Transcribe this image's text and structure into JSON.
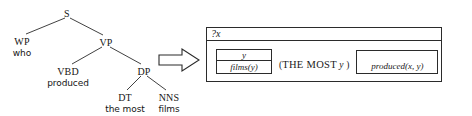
{
  "diagram": {
    "arrow_icon": "right-block-arrow-icon"
  },
  "tree": {
    "nodes": [
      {
        "id": "s",
        "pos": "S",
        "terminal": "",
        "x": 67,
        "y": 8
      },
      {
        "id": "wp",
        "pos": "WP",
        "terminal": "who",
        "x": 22,
        "y": 36
      },
      {
        "id": "vp",
        "pos": "VP",
        "terminal": "",
        "x": 106,
        "y": 37
      },
      {
        "id": "vbd",
        "pos": "VBD",
        "terminal": "produced",
        "x": 68,
        "y": 66
      },
      {
        "id": "dp",
        "pos": "DP",
        "terminal": "",
        "x": 144,
        "y": 66
      },
      {
        "id": "dt",
        "pos": "DT",
        "terminal": "the most",
        "x": 125,
        "y": 92
      },
      {
        "id": "nns",
        "pos": "NNS",
        "terminal": "films",
        "x": 169,
        "y": 92
      }
    ],
    "edges": [
      {
        "from": "s",
        "to": "wp",
        "x1": 65,
        "y1": 18,
        "x2": 26,
        "y2": 34
      },
      {
        "from": "s",
        "to": "vp",
        "x1": 70,
        "y1": 18,
        "x2": 103,
        "y2": 35
      },
      {
        "from": "vp",
        "to": "vbd",
        "x1": 102,
        "y1": 47,
        "x2": 72,
        "y2": 64
      },
      {
        "from": "vp",
        "to": "dp",
        "x1": 110,
        "y1": 47,
        "x2": 141,
        "y2": 64
      },
      {
        "from": "dp",
        "to": "dt",
        "x1": 141,
        "y1": 76,
        "x2": 127,
        "y2": 90
      },
      {
        "from": "dp",
        "to": "nns",
        "x1": 147,
        "y1": 76,
        "x2": 166,
        "y2": 90
      }
    ]
  },
  "drs": {
    "discourse_referent": "?x",
    "films_box": {
      "referent": "y",
      "condition": "films(y)"
    },
    "quantifier": {
      "open_paren": "(",
      "operator": "THE MOST",
      "variable": "y",
      "close_paren": ")"
    },
    "produced_box": {
      "condition": "produced(x, y)"
    }
  },
  "colors": {
    "ink": "#1a1a1a",
    "line": "#2b2b2b",
    "background": "#ffffff"
  }
}
